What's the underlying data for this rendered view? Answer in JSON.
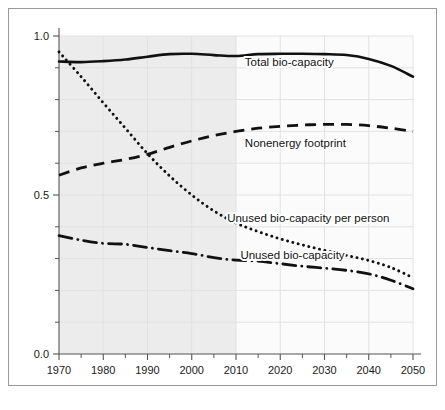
{
  "figure": {
    "background_color": "#ffffff",
    "frame_border_color": "#9a9a9a",
    "plot_shaded_color": "#ececec",
    "plot_projection_color": "#fbfbfb",
    "gridline_color": "#e2e2e2",
    "axis_color": "#555555",
    "series_color": "#111111"
  },
  "chart_data": {
    "type": "line",
    "title": "",
    "subtitle": "",
    "xlabel": "",
    "ylabel": "",
    "xlim": [
      1970,
      2050
    ],
    "ylim": [
      0.0,
      1.0
    ],
    "grid": true,
    "legend_position": "inline-labels",
    "x_ticks_major": [
      1970,
      1980,
      1990,
      2000,
      2010,
      2020,
      2030,
      2040,
      2050
    ],
    "x_tick_labels": [
      "1970",
      "1980",
      "1990",
      "2000",
      "2010",
      "2020",
      "2030",
      "2040",
      "2050"
    ],
    "x_ticks_minor": [
      1975,
      1985,
      1995,
      2005,
      2015,
      2025,
      2035,
      2045
    ],
    "y_ticks_major": [
      0.0,
      0.5,
      1.0
    ],
    "y_tick_labels": [
      "0.0",
      "0.5",
      "1.0"
    ],
    "y_ticks_minor": [
      0.1,
      0.2,
      0.3,
      0.4,
      0.6,
      0.7,
      0.8,
      0.9
    ],
    "shaded_region": {
      "from": 1970,
      "to": 2010,
      "note": "historical period shading"
    },
    "x": [
      1970,
      1975,
      1980,
      1985,
      1990,
      1995,
      2000,
      2005,
      2010,
      2015,
      2020,
      2025,
      2030,
      2035,
      2040,
      2045,
      2050
    ],
    "series": [
      {
        "name": "Total bio-capacity",
        "style": "solid",
        "label": "Total bio-capacity",
        "label_x": 2012,
        "label_y": 0.905,
        "values": [
          0.92,
          0.918,
          0.921,
          0.926,
          0.935,
          0.943,
          0.944,
          0.94,
          0.937,
          0.943,
          0.944,
          0.944,
          0.943,
          0.94,
          0.928,
          0.906,
          0.872
        ]
      },
      {
        "name": "Nonenergy footprint",
        "style": "dashed",
        "label": "Nonenergy footprint",
        "label_x": 2012,
        "label_y": 0.65,
        "values": [
          0.562,
          0.585,
          0.6,
          0.612,
          0.628,
          0.65,
          0.67,
          0.687,
          0.7,
          0.71,
          0.716,
          0.72,
          0.722,
          0.722,
          0.718,
          0.71,
          0.7
        ]
      },
      {
        "name": "Unused bio-capacity per person",
        "style": "dotted",
        "label": "Unused bio-capacity per person",
        "label_x": 2008,
        "label_y": 0.415,
        "values": [
          0.95,
          0.872,
          0.79,
          0.71,
          0.63,
          0.56,
          0.5,
          0.45,
          0.412,
          0.385,
          0.362,
          0.343,
          0.326,
          0.31,
          0.294,
          0.272,
          0.24
        ]
      },
      {
        "name": "Unused  bio-capacity",
        "style": "dashdot",
        "label": "Unused  bio-capacity",
        "label_x": 2011,
        "label_y": 0.3,
        "values": [
          0.372,
          0.358,
          0.348,
          0.345,
          0.335,
          0.325,
          0.316,
          0.303,
          0.295,
          0.292,
          0.284,
          0.276,
          0.27,
          0.263,
          0.252,
          0.232,
          0.205
        ]
      }
    ]
  }
}
